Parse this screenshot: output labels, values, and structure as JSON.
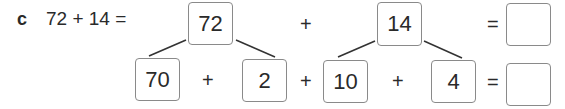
{
  "question": {
    "label": "c",
    "expression": "72 + 14 =",
    "top_row": {
      "left_number": "72",
      "operator": "+",
      "right_number": "14",
      "equals": "=",
      "answer": ""
    },
    "bottom_row": {
      "parts": [
        "70",
        "2",
        "10",
        "4"
      ],
      "operators": [
        "+",
        "+",
        "+"
      ],
      "equals": "=",
      "answer": ""
    }
  }
}
